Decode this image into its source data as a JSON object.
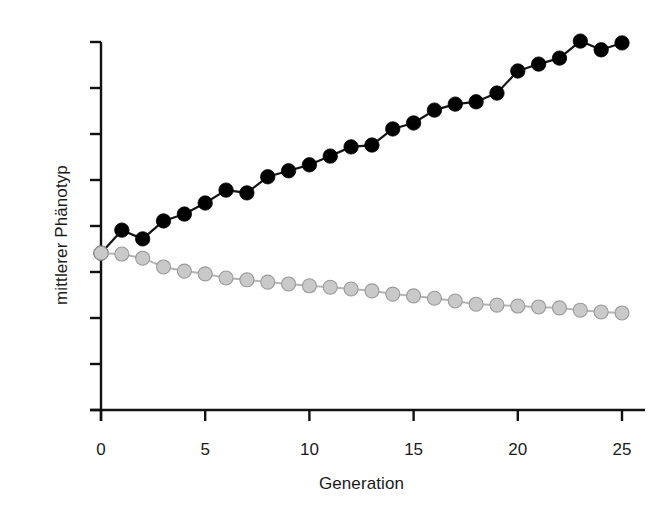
{
  "chart_data": {
    "type": "line",
    "title": "",
    "xlabel": "Generation",
    "ylabel": "mittlerer Phänotyp",
    "grid": false,
    "legend": "none",
    "xlim": [
      0,
      25
    ],
    "ylim": [
      0,
      8
    ],
    "xticks": [
      0,
      5,
      10,
      15,
      20,
      25
    ],
    "xtick_labels": [
      "0",
      "5",
      "10",
      "15",
      "20",
      "25"
    ],
    "yticks": [
      0,
      1,
      2,
      3,
      4,
      5,
      6,
      7,
      8
    ],
    "ytick_labels": [
      "",
      "",
      "",
      "",
      "",
      "",
      "",
      "",
      ""
    ],
    "y_axis_note": "y-axis ticks are unlabeled; values given in tick units (0 = bottom tick, 8 = top tick)",
    "x": [
      0,
      1,
      2,
      3,
      4,
      5,
      6,
      7,
      8,
      9,
      10,
      11,
      12,
      13,
      14,
      15,
      16,
      17,
      18,
      19,
      20,
      21,
      22,
      23,
      24,
      25
    ],
    "series": [
      {
        "name": "Selektion nach oben",
        "marker": "filled-circle",
        "color": "#000000",
        "edge_color": "#000000",
        "values": [
          3.41,
          3.91,
          3.72,
          4.11,
          4.26,
          4.5,
          4.78,
          4.72,
          5.07,
          5.2,
          5.33,
          5.52,
          5.72,
          5.76,
          6.11,
          6.24,
          6.52,
          6.65,
          6.7,
          6.89,
          7.37,
          7.52,
          7.65,
          8.02,
          7.83,
          7.98
        ]
      },
      {
        "name": "Selektion nach unten",
        "marker": "filled-circle",
        "color": "#c9c9c9",
        "edge_color": "#9a9a9a",
        "values": [
          3.41,
          3.39,
          3.3,
          3.11,
          3.02,
          2.96,
          2.87,
          2.83,
          2.78,
          2.74,
          2.7,
          2.67,
          2.63,
          2.59,
          2.52,
          2.48,
          2.43,
          2.37,
          2.3,
          2.28,
          2.26,
          2.24,
          2.22,
          2.17,
          2.13,
          2.11
        ]
      }
    ]
  },
  "axes": {
    "x_axis_name": "generation-axis",
    "y_axis_name": "phenotype-axis"
  }
}
